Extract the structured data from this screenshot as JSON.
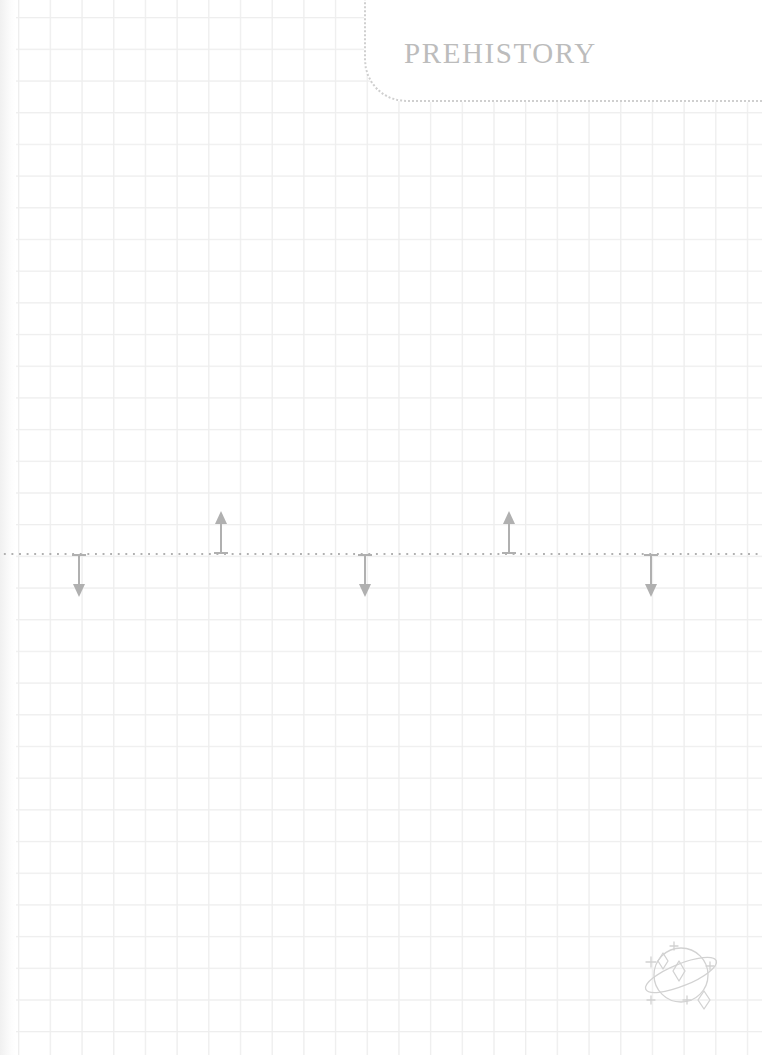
{
  "page": {
    "title": "PREHISTORY",
    "background_color": "#ffffff",
    "grid_color": "#ededed",
    "grid_cell_px": 31.7,
    "width_px": 762,
    "height_px": 1055
  },
  "header": {
    "title": "PREHISTORY",
    "border_style": "dotted",
    "border_color": "#cfcfcf",
    "corner_radius_px": 42,
    "title_color": "#bcbcbc"
  },
  "timeline": {
    "axis_label": "",
    "axis_style": "dotted",
    "axis_color": "#b0b0b0",
    "axis_y_px": 554,
    "marker_color": "#b0b0b0",
    "markers": [
      {
        "name": "marker-1",
        "direction": "down",
        "x_px": 71,
        "label": ""
      },
      {
        "name": "marker-2",
        "direction": "up",
        "x_px": 213,
        "label": ""
      },
      {
        "name": "marker-3",
        "direction": "down",
        "x_px": 357,
        "label": ""
      },
      {
        "name": "marker-4",
        "direction": "up",
        "x_px": 501,
        "label": ""
      },
      {
        "name": "marker-5",
        "direction": "down",
        "x_px": 643,
        "label": ""
      }
    ]
  },
  "decoration": {
    "badge_icon": "planet-with-ring-and-sparkles-icon",
    "badge_color": "#d2d2d2"
  }
}
